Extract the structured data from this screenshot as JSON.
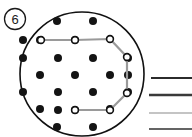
{
  "figure": {
    "index_label": "6",
    "index_label_name": "circled-number-6",
    "colors": {
      "outline": "#111111",
      "dot_fill": "#141414",
      "path_stroke": "#9a9a9a",
      "vertex_stroke": "#111111",
      "vertex_fill": "#ffffff",
      "background": "#ffffff"
    },
    "boundary_circle": {
      "cx": 82,
      "cy": 74,
      "r": 62,
      "stroke_width": 1.6
    },
    "lattice_dots": [
      {
        "x": 57,
        "y": 21,
        "r": 4.0
      },
      {
        "x": 93,
        "y": 21,
        "r": 4.0
      },
      {
        "x": 23,
        "y": 40,
        "r": 4.0
      },
      {
        "x": 23,
        "y": 58,
        "r": 4.0
      },
      {
        "x": 58,
        "y": 58,
        "r": 4.0
      },
      {
        "x": 93,
        "y": 58,
        "r": 4.0
      },
      {
        "x": 128,
        "y": 58,
        "r": 4.0
      },
      {
        "x": 40,
        "y": 75,
        "r": 4.0
      },
      {
        "x": 75,
        "y": 75,
        "r": 4.0
      },
      {
        "x": 110,
        "y": 75,
        "r": 4.0
      },
      {
        "x": 23,
        "y": 92,
        "r": 4.0
      },
      {
        "x": 58,
        "y": 92,
        "r": 4.0
      },
      {
        "x": 93,
        "y": 92,
        "r": 4.0
      },
      {
        "x": 40,
        "y": 109,
        "r": 4.0
      },
      {
        "x": 75,
        "y": 40,
        "r": 4.0
      },
      {
        "x": 40,
        "y": 40,
        "r": 4.0
      },
      {
        "x": 57,
        "y": 127,
        "r": 4.0
      },
      {
        "x": 93,
        "y": 127,
        "r": 4.0
      },
      {
        "x": 58,
        "y": 110,
        "r": 4.0
      },
      {
        "x": 110,
        "y": 109,
        "r": 4.0
      },
      {
        "x": 128,
        "y": 92,
        "r": 4.0
      },
      {
        "x": 75,
        "y": 110,
        "r": 4.0
      },
      {
        "x": 128,
        "y": 75,
        "r": 4.0
      }
    ],
    "polygon_path": {
      "points": [
        {
          "x": 41,
          "y": 40
        },
        {
          "x": 75,
          "y": 40
        },
        {
          "x": 110,
          "y": 39
        },
        {
          "x": 127,
          "y": 57
        },
        {
          "x": 127,
          "y": 93
        },
        {
          "x": 110,
          "y": 110
        },
        {
          "x": 75,
          "y": 110
        }
      ],
      "closed": false,
      "stroke_width": 2.2,
      "vertex_radius": 3.4
    },
    "legend_lines": [
      {
        "x1": 151,
        "x2": 192,
        "y": 78,
        "width": 2.0,
        "color": "#2b2b2b",
        "name": "legend-line-1"
      },
      {
        "x1": 149,
        "x2": 192,
        "y": 95,
        "width": 2.4,
        "color": "#3a3a3a",
        "name": "legend-line-2"
      },
      {
        "x1": 149,
        "x2": 192,
        "y": 113,
        "width": 1.2,
        "color": "#8a8a8a",
        "name": "legend-line-3"
      },
      {
        "x1": 149,
        "x2": 192,
        "y": 129,
        "width": 1.6,
        "color": "#303030",
        "name": "legend-line-4"
      }
    ]
  }
}
